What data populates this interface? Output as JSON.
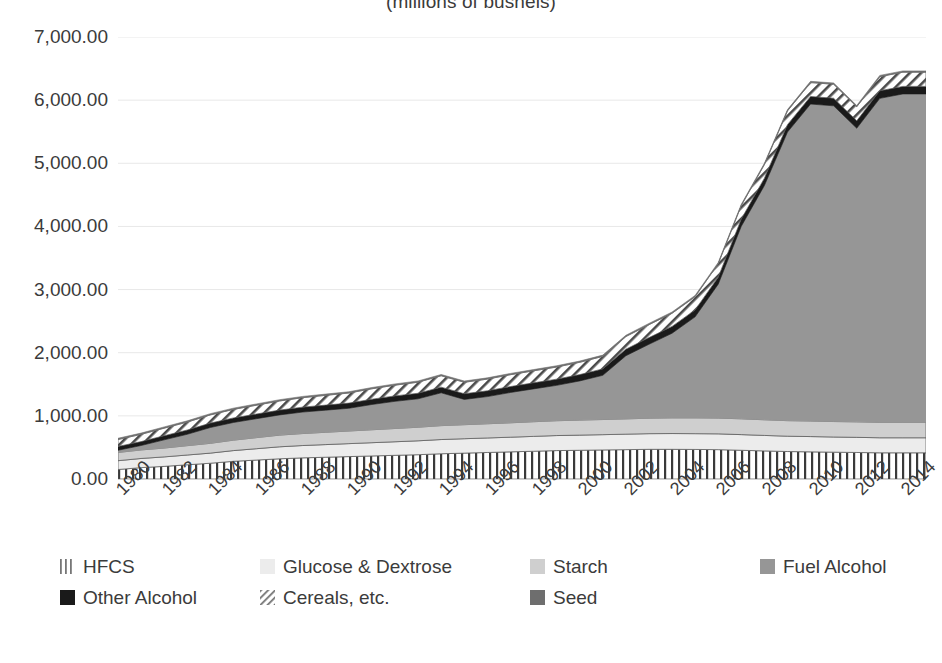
{
  "chart_data": {
    "type": "area",
    "stacked": true,
    "title": "(millions of bushels)",
    "xlabel": "",
    "ylabel": "",
    "ylim": [
      0,
      7000
    ],
    "ytick_step": 1000,
    "grid": true,
    "grid_axis": "y",
    "legend_position": "bottom",
    "x": [
      1980,
      1981,
      1982,
      1983,
      1984,
      1985,
      1986,
      1987,
      1988,
      1989,
      1990,
      1991,
      1992,
      1993,
      1994,
      1995,
      1996,
      1997,
      1998,
      1999,
      2000,
      2001,
      2002,
      2003,
      2004,
      2005,
      2006,
      2007,
      2008,
      2009,
      2010,
      2011,
      2012,
      2013,
      2014,
      2015
    ],
    "tick_labels": [
      "1980",
      "1982",
      "1984",
      "1986",
      "1988",
      "1990",
      "1992",
      "1994",
      "1996",
      "1998",
      "2000",
      "2002",
      "2004",
      "2006",
      "2008",
      "2010",
      "2012",
      "2014"
    ],
    "ytick_labels": [
      "0.00",
      "1,000.00",
      "2,000.00",
      "3,000.00",
      "4,000.00",
      "5,000.00",
      "6,000.00",
      "7,000.00"
    ],
    "series": [
      {
        "name": "HFCS",
        "pattern": "vertical-lines",
        "color": "#f2f2f2",
        "values": [
          150,
          180,
          200,
          225,
          250,
          280,
          300,
          320,
          335,
          345,
          355,
          365,
          375,
          385,
          400,
          410,
          420,
          430,
          440,
          450,
          455,
          460,
          465,
          470,
          470,
          468,
          465,
          455,
          445,
          435,
          430,
          425,
          420,
          415,
          415,
          415
        ]
      },
      {
        "name": "Glucose & Dextrose",
        "pattern": "solid",
        "color": "#ececec",
        "values": [
          140,
          145,
          150,
          155,
          160,
          170,
          180,
          190,
          195,
          200,
          205,
          210,
          215,
          220,
          225,
          228,
          230,
          232,
          235,
          238,
          240,
          242,
          245,
          248,
          250,
          250,
          250,
          248,
          245,
          243,
          242,
          240,
          240,
          238,
          238,
          238
        ]
      },
      {
        "name": "Starch",
        "pattern": "solid",
        "color": "#cfcfcf",
        "values": [
          130,
          135,
          140,
          148,
          155,
          165,
          175,
          185,
          190,
          195,
          200,
          205,
          210,
          215,
          220,
          222,
          225,
          228,
          232,
          235,
          238,
          240,
          242,
          245,
          248,
          250,
          250,
          250,
          248,
          246,
          246,
          245,
          245,
          245,
          245,
          245
        ]
      },
      {
        "name": "Fuel Alcohol",
        "pattern": "solid",
        "color": "#969696",
        "values": [
          35,
          70,
          130,
          180,
          250,
          280,
          300,
          320,
          340,
          350,
          360,
          400,
          430,
          450,
          520,
          400,
          430,
          480,
          520,
          560,
          620,
          700,
          1000,
          1170,
          1340,
          1600,
          2120,
          3050,
          3710,
          4570,
          5020,
          5000,
          4650,
          5130,
          5200,
          5200
        ]
      },
      {
        "name": "Other Alcohol",
        "pattern": "solid",
        "color": "#1a1a1a",
        "values": [
          60,
          62,
          65,
          68,
          70,
          72,
          74,
          76,
          78,
          80,
          82,
          84,
          86,
          88,
          90,
          90,
          92,
          94,
          96,
          98,
          100,
          102,
          104,
          106,
          108,
          110,
          112,
          114,
          116,
          118,
          120,
          120,
          118,
          120,
          120,
          120
        ]
      },
      {
        "name": "Cereals, etc.",
        "pattern": "diagonal-hatch",
        "color": "#ffffff",
        "values": [
          110,
          115,
          120,
          125,
          130,
          135,
          140,
          145,
          150,
          155,
          160,
          165,
          170,
          175,
          180,
          182,
          185,
          188,
          190,
          192,
          195,
          198,
          200,
          205,
          208,
          210,
          212,
          214,
          216,
          218,
          220,
          222,
          222,
          224,
          225,
          225
        ]
      },
      {
        "name": "Seed",
        "pattern": "solid",
        "color": "#6e6e6e",
        "values": [
          20,
          20,
          20,
          20,
          20,
          20,
          20,
          20,
          20,
          20,
          20,
          20,
          20,
          20,
          20,
          20,
          20,
          20,
          20,
          20,
          20,
          20,
          20,
          20,
          20,
          20,
          20,
          20,
          20,
          20,
          20,
          20,
          20,
          20,
          20,
          20
        ]
      }
    ],
    "totals": [
      645,
      727,
      825,
      921,
      1035,
      1122,
      1189,
      1256,
      1308,
      1345,
      1382,
      1449,
      1506,
      1553,
      1655,
      1552,
      1622,
      1722,
      1833,
      1893,
      1988,
      2062,
      2376,
      2564,
      2744,
      3008,
      3529,
      4451,
      5100,
      5970,
      6418,
      6392,
      5735,
      6412,
      6483,
      6483
    ]
  },
  "legend": {
    "rows": [
      [
        {
          "label": "HFCS",
          "swatch": "hfcs-swatch"
        },
        {
          "label": "Glucose & Dextrose",
          "swatch": "glucose-dextrose-swatch"
        },
        {
          "label": "Starch",
          "swatch": "starch-swatch"
        },
        {
          "label": "Fuel Alcohol",
          "swatch": "fuel-alcohol-swatch"
        }
      ],
      [
        {
          "label": "Other Alcohol",
          "swatch": "other-alcohol-swatch"
        },
        {
          "label": "Cereals, etc.",
          "swatch": "cereals-swatch"
        },
        {
          "label": "Seed",
          "swatch": "seed-swatch"
        }
      ]
    ]
  },
  "colors": {
    "hfcs": "#f2f2f2",
    "glucose_dextrose": "#ececec",
    "starch": "#cfcfcf",
    "fuel_alcohol": "#969696",
    "other_alcohol": "#1a1a1a",
    "cereals": "#ffffff",
    "seed": "#6e6e6e",
    "text": "#3b3b3b",
    "gridline": "#e8e8e8",
    "background": "#ffffff"
  }
}
